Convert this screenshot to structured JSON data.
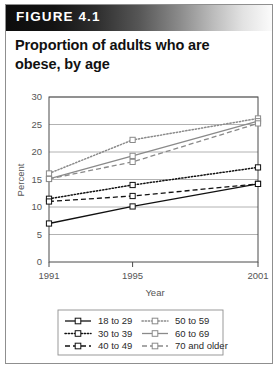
{
  "figure": {
    "banner_label": "FIGURE 4.1",
    "title_line1": "Proportion of adults who are",
    "title_line2": "obese, by age"
  },
  "colors": {
    "banner_dark": "#0c0c0c",
    "banner_light": "#fbfbfb",
    "frame": "#8f8f8f",
    "grid": "#a9a9a9",
    "axis": "#4a4a4a",
    "series_dark": "#111111",
    "series_gray": "#8a8a8a",
    "text": "#555555"
  },
  "chart_data": {
    "type": "line",
    "title": "Proportion of adults who are obese, by age",
    "xlabel": "Year",
    "ylabel": "Percent",
    "x": [
      1991,
      1995,
      2001
    ],
    "xtick_labels": [
      "1991",
      "1995",
      "2001"
    ],
    "ytick_labels": [
      "0",
      "5",
      "10",
      "15",
      "20",
      "25",
      "30"
    ],
    "yticks": [
      0,
      5,
      10,
      15,
      20,
      25,
      30
    ],
    "ylim": [
      0,
      30
    ],
    "grid": "horizontal",
    "legend_position": "below-plot",
    "series": [
      {
        "name": "18 to 29",
        "values": [
          7.0,
          10.1,
          14.2
        ],
        "style": "solid",
        "color": "#111111"
      },
      {
        "name": "30 to 39",
        "values": [
          11.5,
          14.0,
          17.2
        ],
        "style": "dotted",
        "color": "#111111"
      },
      {
        "name": "40 to 49",
        "values": [
          11.0,
          12.0,
          14.2
        ],
        "style": "dashed",
        "color": "#111111"
      },
      {
        "name": "50 to 59",
        "values": [
          16.1,
          22.2,
          26.1
        ],
        "style": "dotted",
        "color": "#8a8a8a"
      },
      {
        "name": "60 to 69",
        "values": [
          15.1,
          19.3,
          25.6
        ],
        "style": "solid",
        "color": "#8a8a8a"
      },
      {
        "name": "70 and older",
        "values": [
          15.1,
          18.2,
          25.2
        ],
        "style": "dashed",
        "color": "#8a8a8a"
      }
    ]
  },
  "legend": {
    "entries": [
      {
        "label": "18 to 29"
      },
      {
        "label": "50 to 59"
      },
      {
        "label": "30 to 39"
      },
      {
        "label": "60 to 69"
      },
      {
        "label": "40 to 49"
      },
      {
        "label": "70 and older"
      }
    ]
  }
}
